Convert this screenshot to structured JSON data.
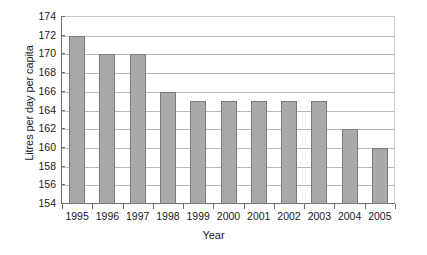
{
  "chart_data": {
    "type": "bar",
    "title": "",
    "xlabel": "Year",
    "ylabel": "Litres per day per capita",
    "categories": [
      "1995",
      "1996",
      "1997",
      "1998",
      "1999",
      "2000",
      "2001",
      "2002",
      "2003",
      "2004",
      "2005"
    ],
    "values": [
      172,
      170,
      170,
      166,
      165,
      165,
      165,
      165,
      165,
      162,
      160
    ],
    "ylim": [
      154,
      174
    ],
    "ytick_step": 2,
    "yticks": [
      174,
      172,
      170,
      168,
      166,
      164,
      162,
      160,
      158,
      156,
      154
    ],
    "grid": true,
    "legend": "none",
    "series": [
      {
        "name": "Litres per day per capita",
        "values": [
          172,
          170,
          170,
          166,
          165,
          165,
          165,
          165,
          165,
          162,
          160
        ]
      }
    ],
    "colors": {
      "bar_fill": "#a9a9a9",
      "bar_border": "#7a7a7a",
      "gridline": "#b9b9b9",
      "axis": "#6e6e6e",
      "background": "#ffffff",
      "text": "#1a1a1a"
    }
  }
}
